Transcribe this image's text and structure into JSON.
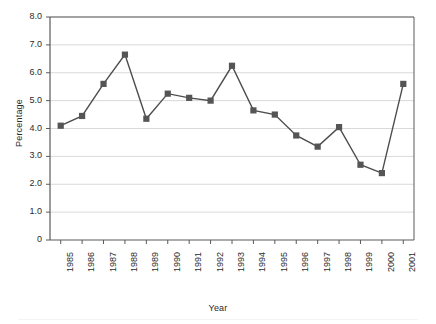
{
  "chart_data": {
    "type": "line",
    "title": "",
    "xlabel": "Year",
    "ylabel": "Percentage",
    "categories": [
      "1985",
      "1986",
      "1987",
      "1988",
      "1989",
      "1990",
      "1991",
      "1992",
      "1993",
      "1994",
      "1995",
      "1996",
      "1997",
      "1998",
      "1999",
      "2000",
      "2001"
    ],
    "values": [
      4.1,
      4.45,
      5.6,
      6.65,
      4.35,
      5.25,
      5.1,
      5.0,
      6.25,
      4.65,
      4.5,
      3.75,
      3.35,
      4.05,
      2.7,
      2.4,
      5.6
    ],
    "series": [
      {
        "name": "Percentage",
        "values": [
          4.1,
          4.45,
          5.6,
          6.65,
          4.35,
          5.25,
          5.1,
          5.0,
          6.25,
          4.65,
          4.5,
          3.75,
          3.35,
          4.05,
          2.7,
          2.4,
          5.6
        ]
      }
    ],
    "ylim": [
      0,
      8
    ],
    "ytick_labels": [
      "8.0",
      "7.0",
      "6.0",
      "5.0",
      "4.0",
      "3.0",
      "2.0",
      "1.0",
      "0"
    ],
    "ytick_values": [
      8,
      7,
      6,
      5,
      4,
      3,
      2,
      1,
      0
    ],
    "grid": true,
    "legend": "none",
    "marker": "square",
    "line_color": "#4d4d4d",
    "marker_color": "#555555",
    "grid_color": "#d9d9d9",
    "axis_color": "#5a5a5a",
    "background": "#ffffff"
  }
}
